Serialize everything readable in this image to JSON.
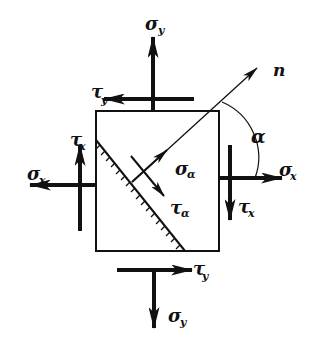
{
  "diagram": {
    "colors": {
      "stroke": "#111111",
      "background": "#ffffff"
    },
    "labels": {
      "sigma_y_top": {
        "main": "σ",
        "sub": "y"
      },
      "tau_y_top": {
        "main": "τ",
        "sub": "y"
      },
      "n_axis": {
        "main": "n"
      },
      "alpha": {
        "main": "α"
      },
      "tau_x_left": {
        "main": "τ",
        "sub": "x"
      },
      "sigma_x_left": {
        "main": "σ",
        "sub": "x"
      },
      "sigma_alpha": {
        "main": "σ",
        "sub": "α"
      },
      "sigma_x_right": {
        "main": "σ",
        "sub": "x"
      },
      "tau_x_right": {
        "main": "τ",
        "sub": "x"
      },
      "tau_alpha": {
        "main": "τ",
        "sub": "α"
      },
      "tau_y_bottom": {
        "main": "τ",
        "sub": "y"
      },
      "sigma_y_bottom": {
        "main": "σ",
        "sub": "y"
      }
    }
  }
}
